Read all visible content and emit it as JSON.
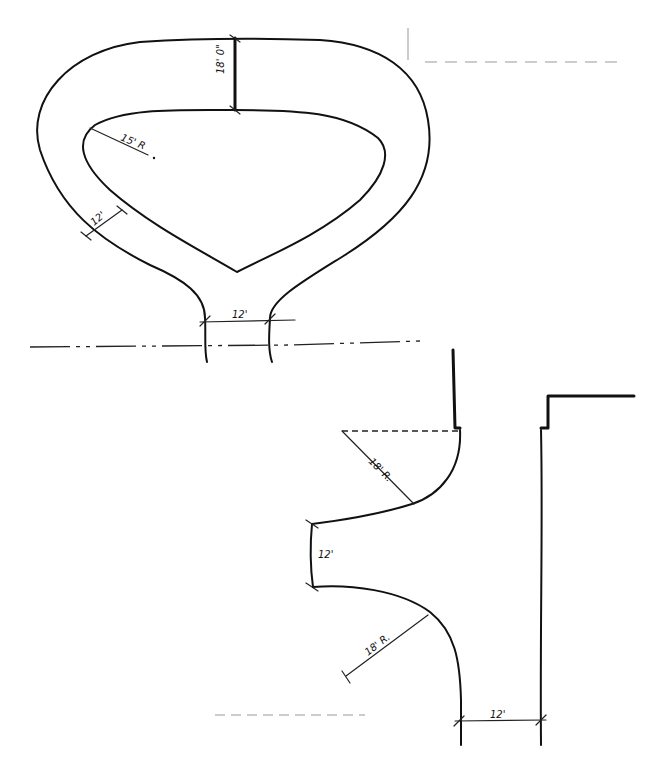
{
  "diagram": {
    "type": "hand-drawn site plan sketch",
    "upper_loop": {
      "description": "Teardrop-shaped turnaround loop with central island",
      "dimensions": {
        "top_lane_width": "18' 0\"",
        "island_radius": "15' R",
        "side_lane_width": "12'",
        "neck_width": "12'"
      }
    },
    "lower_section": {
      "description": "Curved entry with two radius returns and a straight lane",
      "dimensions": {
        "upper_return_radius": "18' R.",
        "opening_width": "12'",
        "lower_return_radius": "18' R.",
        "lane_width": "12'"
      }
    },
    "centerline": "dash-dot horizontal centerline at y≈345",
    "colors": {
      "ink": "#111111",
      "background": "#ffffff"
    }
  }
}
